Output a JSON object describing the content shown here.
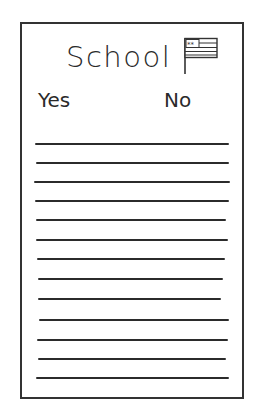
{
  "card": {
    "title": "School",
    "columns": {
      "yes": "Yes",
      "no": "No"
    },
    "icon": "flag-icon",
    "line_count": 13,
    "lines": [
      {
        "y": 143,
        "x1": 35,
        "x2": 229
      },
      {
        "y": 162,
        "x1": 36,
        "x2": 229
      },
      {
        "y": 181,
        "x1": 34,
        "x2": 230
      },
      {
        "y": 200,
        "x1": 35,
        "x2": 229
      },
      {
        "y": 219,
        "x1": 36,
        "x2": 226
      },
      {
        "y": 239,
        "x1": 36,
        "x2": 228
      },
      {
        "y": 258,
        "x1": 37,
        "x2": 225
      },
      {
        "y": 278,
        "x1": 38,
        "x2": 223
      },
      {
        "y": 298,
        "x1": 38,
        "x2": 221
      },
      {
        "y": 319,
        "x1": 39,
        "x2": 229
      },
      {
        "y": 339,
        "x1": 37,
        "x2": 228
      },
      {
        "y": 358,
        "x1": 38,
        "x2": 226
      },
      {
        "y": 377,
        "x1": 36,
        "x2": 229
      }
    ]
  }
}
